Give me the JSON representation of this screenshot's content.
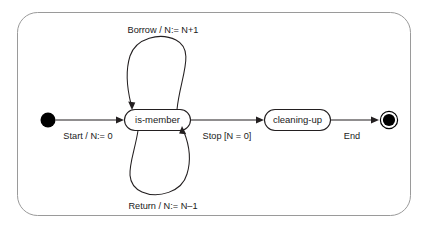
{
  "diagram": {
    "kind": "uml-state-machine",
    "title": "",
    "frame": {
      "border_color": "#9a9a9a",
      "background": "#ffffff"
    },
    "ink_color": "#231f20",
    "states": [
      {
        "id": "initial",
        "type": "initial-pseudostate",
        "label": ""
      },
      {
        "id": "is-member",
        "type": "simple-state",
        "label": "is-member"
      },
      {
        "id": "cleaning-up",
        "type": "simple-state",
        "label": "cleaning-up"
      },
      {
        "id": "final",
        "type": "final-state",
        "label": ""
      }
    ],
    "transitions": [
      {
        "id": "start",
        "from": "initial",
        "to": "is-member",
        "label": "Start / N:= 0"
      },
      {
        "id": "borrow",
        "from": "is-member",
        "to": "is-member",
        "label": "Borrow / N:= N+1"
      },
      {
        "id": "return",
        "from": "is-member",
        "to": "is-member",
        "label": "Return / N:= N–1"
      },
      {
        "id": "stop",
        "from": "is-member",
        "to": "cleaning-up",
        "label": "Stop [N = 0]"
      },
      {
        "id": "end",
        "from": "cleaning-up",
        "to": "final",
        "label": "End"
      }
    ]
  }
}
